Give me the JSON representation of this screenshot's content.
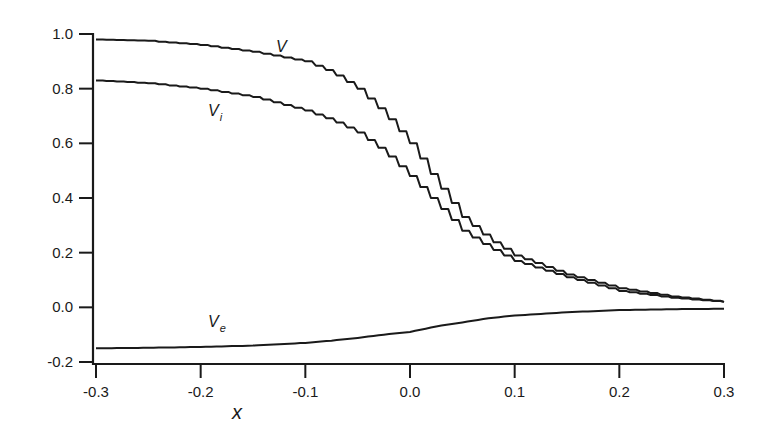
{
  "chart_data": {
    "type": "line",
    "title": "",
    "xlabel": "x",
    "ylabel": "",
    "xlim": [
      -0.3,
      0.3
    ],
    "ylim": [
      -0.2,
      1.0
    ],
    "grid": false,
    "legend": "inline labels",
    "x_ticks": [
      "-0.3",
      "-0.2",
      "-0.1",
      "0.0",
      "0.1",
      "0.2",
      "0.3"
    ],
    "y_ticks": [
      "-0.2",
      "0.0",
      "0.2",
      "0.4",
      "0.6",
      "0.8",
      "1.0"
    ],
    "x": [
      -0.3,
      -0.25,
      -0.2,
      -0.15,
      -0.1,
      -0.075,
      -0.05,
      -0.025,
      0.0,
      0.025,
      0.05,
      0.075,
      0.1,
      0.15,
      0.2,
      0.25,
      0.3
    ],
    "series": [
      {
        "name": "V",
        "label_main": "V",
        "label_sub": "",
        "style": "stepped",
        "values": [
          0.98,
          0.975,
          0.96,
          0.935,
          0.9,
          0.86,
          0.8,
          0.71,
          0.6,
          0.46,
          0.33,
          0.25,
          0.19,
          0.12,
          0.07,
          0.04,
          0.02
        ]
      },
      {
        "name": "V_i",
        "label_main": "V",
        "label_sub": "i",
        "style": "stepped",
        "values": [
          0.83,
          0.82,
          0.8,
          0.77,
          0.72,
          0.685,
          0.64,
          0.57,
          0.48,
          0.38,
          0.28,
          0.22,
          0.17,
          0.11,
          0.06,
          0.035,
          0.02
        ]
      },
      {
        "name": "V_e",
        "label_main": "V",
        "label_sub": "e",
        "style": "smooth",
        "values": [
          -0.15,
          -0.148,
          -0.145,
          -0.14,
          -0.13,
          -0.122,
          -0.112,
          -0.1,
          -0.09,
          -0.07,
          -0.055,
          -0.04,
          -0.03,
          -0.018,
          -0.01,
          -0.007,
          -0.005
        ]
      }
    ]
  }
}
